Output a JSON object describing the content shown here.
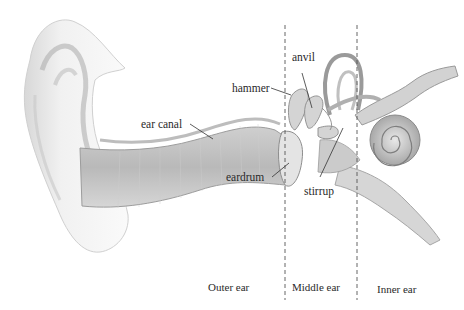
{
  "diagram": {
    "labels": {
      "ear_canal": "ear canal",
      "hammer": "hammer",
      "anvil": "anvil",
      "eardrum": "eardrum",
      "stirrup": "stirrup"
    },
    "sections": {
      "outer": "Outer ear",
      "middle": "Middle ear",
      "inner": "Inner ear"
    },
    "colors": {
      "ink": "#2a2a2a",
      "shade_dark": "#9a9a9a",
      "shade_mid": "#c4c4c4",
      "shade_light": "#e6e6e6",
      "background": "#ffffff"
    }
  }
}
